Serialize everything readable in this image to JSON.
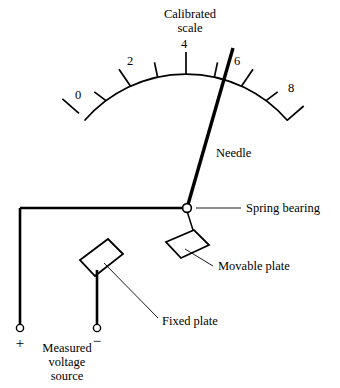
{
  "figure": {
    "kind": "electrostatic-voltmeter-schematic",
    "background_color": "#ffffff",
    "ink_color": "#000000",
    "width": 340,
    "height": 388
  },
  "scale": {
    "title_line1": "Calibrated",
    "title_line2": "scale",
    "numbers": [
      "0",
      "2",
      "4",
      "6",
      "8"
    ],
    "number_positions": [
      {
        "label": "0",
        "x": 78,
        "y": 99
      },
      {
        "label": "2",
        "x": 130,
        "y": 65
      },
      {
        "label": "4",
        "x": 184,
        "y": 56
      },
      {
        "label": "6",
        "x": 237,
        "y": 65
      },
      {
        "label": "8",
        "x": 290,
        "y": 90
      }
    ],
    "arc": {
      "center_x": 186,
      "center_y": 208,
      "radius": 134,
      "start_angle_deg": 221,
      "end_angle_deg": 319
    },
    "major_tick_count": 5,
    "minor_tick_count": 4,
    "total_tick_count": 9,
    "major_tick_length": 22,
    "minor_tick_length": 15,
    "needle_reading": "6"
  },
  "labels": {
    "needle": "Needle",
    "spring_bearing": "Spring bearing",
    "movable_plate": "Movable plate",
    "fixed_plate": "Fixed plate",
    "source_line1": "Measured",
    "source_line2": "voltage",
    "source_line3": "source",
    "plus_sign": "+",
    "minus_sign": "−"
  },
  "components": {
    "needle": {
      "pivot_x": 187,
      "pivot_y": 208,
      "tip_x": 233,
      "tip_y": 48
    },
    "spring_bearing": {
      "cx": 187,
      "cy": 208,
      "r": 4.4
    },
    "movable_plate": {
      "points": "166,242 194,230 209,245 181,258"
    },
    "fixed_plate": {
      "points": "80,260 108,239 123,254 95,276"
    },
    "terminal_plus": {
      "cx": 20,
      "cy": 327,
      "r": 3.6
    },
    "terminal_minus": {
      "cx": 97,
      "cy": 327,
      "r": 3.6
    }
  }
}
